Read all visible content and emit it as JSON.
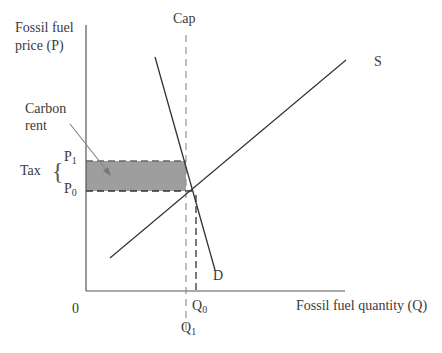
{
  "diagram": {
    "y_axis_label_line1": "Fossil fuel",
    "y_axis_label_line2": "price (P)",
    "x_axis_label": "Fossil fuel quantity (Q)",
    "origin_label": "0",
    "cap_label": "Cap",
    "supply_label": "S",
    "demand_label": "D",
    "carbon_rent_line1": "Carbon",
    "carbon_rent_line2": "rent",
    "tax_label": "Tax",
    "tax_brace": "{",
    "p1": {
      "base": "P",
      "sub": "1"
    },
    "p0": {
      "base": "P",
      "sub": "0"
    },
    "q0": {
      "base": "Q",
      "sub": "0"
    },
    "q1": {
      "base": "Q",
      "sub": "1"
    },
    "colors": {
      "line": "#333333",
      "shade": "#9a9a9a",
      "dash": "#888888"
    }
  }
}
